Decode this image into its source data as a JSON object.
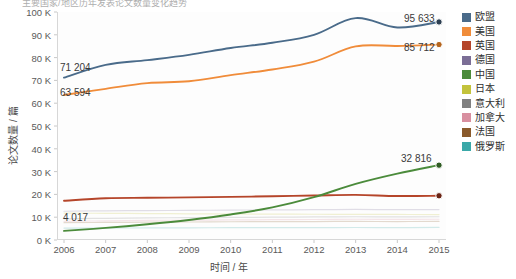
{
  "title": "主要国家/地区历年发表论文数量变化趋势",
  "axes": {
    "ylabel": "论文数量 / 篇",
    "xlabel": "时间 / 年",
    "yticks": [
      "100 K",
      "90 K",
      "80 K",
      "70 K",
      "60 K",
      "50 K",
      "40 K",
      "30 K",
      "20 K",
      "10 K",
      "0 K"
    ],
    "xticks": [
      "2006",
      "2007",
      "2008",
      "2009",
      "2010",
      "2011",
      "2012",
      "2013",
      "2014",
      "2015"
    ]
  },
  "annotations": [
    {
      "name": "eu-start-label",
      "text": "71 204",
      "x": 60,
      "y": 62
    },
    {
      "name": "us-start-label",
      "text": "63 594",
      "x": 60,
      "y": 87
    },
    {
      "name": "eu-end-label",
      "text": "95 633",
      "x": 404,
      "y": 13
    },
    {
      "name": "us-end-label",
      "text": "85 712",
      "x": 404,
      "y": 42
    },
    {
      "name": "china-end-label",
      "text": "32 816",
      "x": 401,
      "y": 153
    },
    {
      "name": "china-start-label",
      "text": "4 017",
      "x": 63,
      "y": 212
    }
  ],
  "chart_data": {
    "type": "line",
    "title": "主要国家/地区历年发表论文数量变化趋势",
    "xlabel": "时间 / 年",
    "ylabel": "论文数量 / 篇",
    "x": [
      2006,
      2007,
      2008,
      2009,
      2010,
      2011,
      2012,
      2013,
      2014,
      2015
    ],
    "ylim": [
      0,
      100000
    ],
    "ytick_values": [
      100000,
      90000,
      80000,
      70000,
      60000,
      50000,
      40000,
      30000,
      20000,
      10000,
      0
    ],
    "grid": false,
    "legend_position": "right",
    "series": [
      {
        "name": "欧盟",
        "color": "#4a6b8a",
        "values": [
          71204,
          76800,
          78900,
          81200,
          84200,
          86500,
          90000,
          97300,
          93200,
          95633
        ],
        "endpoint_marker": true
      },
      {
        "name": "美国",
        "color": "#f08c3a",
        "values": [
          63594,
          66300,
          68800,
          69600,
          72300,
          74800,
          78200,
          84900,
          85100,
          85712
        ],
        "endpoint_marker": true
      },
      {
        "name": "英国",
        "color": "#b5452a",
        "values": [
          17200,
          18300,
          18500,
          18700,
          18900,
          19200,
          19500,
          19800,
          19300,
          19400
        ],
        "endpoint_marker": true
      },
      {
        "name": "德国",
        "color": "#7b6e96",
        "values": [
          12600,
          12800,
          12900,
          13000,
          13100,
          13200,
          13300,
          13400,
          13300,
          13350
        ],
        "endpoint_marker": false
      },
      {
        "name": "中国",
        "color": "#4b8b3b",
        "values": [
          4017,
          5300,
          6900,
          8800,
          11200,
          14300,
          18800,
          24600,
          29100,
          32816
        ],
        "endpoint_marker": true
      },
      {
        "name": "日本",
        "color": "#c3c33c",
        "values": [
          11800,
          11700,
          11600,
          11500,
          11400,
          11350,
          11300,
          11250,
          11200,
          11150
        ],
        "endpoint_marker": false
      },
      {
        "name": "意大利",
        "color": "#808080",
        "values": [
          9300,
          9500,
          9700,
          9800,
          9900,
          10000,
          10100,
          10200,
          10150,
          10200
        ],
        "endpoint_marker": false
      },
      {
        "name": "加拿大",
        "color": "#d88fa0",
        "values": [
          8200,
          8400,
          8600,
          8700,
          8800,
          8900,
          9000,
          9100,
          9050,
          9100
        ],
        "endpoint_marker": false
      },
      {
        "name": "法国",
        "color": "#8a5a2b",
        "values": [
          7600,
          7700,
          7800,
          7900,
          8000,
          8050,
          8100,
          8150,
          8100,
          8150
        ],
        "endpoint_marker": false
      },
      {
        "name": "俄罗斯",
        "color": "#3aa8a8",
        "values": [
          5200,
          5250,
          5300,
          5350,
          5400,
          5420,
          5450,
          5480,
          5450,
          5500
        ],
        "endpoint_marker": false
      }
    ]
  }
}
